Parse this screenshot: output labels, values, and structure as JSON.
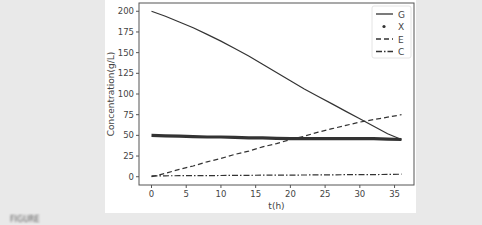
{
  "chart_data": {
    "type": "line",
    "title": "",
    "xlabel": "t(h)",
    "ylabel": "Concentration(g/L)",
    "xlim": [
      -1.8,
      37.8
    ],
    "ylim": [
      -10,
      210
    ],
    "xticks": [
      0,
      5,
      10,
      15,
      20,
      25,
      30,
      35
    ],
    "yticks": [
      0,
      25,
      50,
      75,
      100,
      125,
      150,
      175,
      200
    ],
    "grid": false,
    "legend_position": "upper right",
    "x": [
      0,
      2,
      4,
      6,
      8,
      10,
      12,
      14,
      16,
      18,
      20,
      22,
      24,
      26,
      28,
      30,
      32,
      34,
      36
    ],
    "series": [
      {
        "name": "G",
        "style": "solid",
        "values": [
          200,
          194,
          187,
          180,
          172,
          164,
          155,
          146,
          136,
          126,
          116,
          106,
          97,
          88,
          79,
          70,
          61,
          52,
          45
        ]
      },
      {
        "name": "X",
        "style": "dots",
        "values": [
          50,
          49.5,
          49,
          48.5,
          48,
          48,
          47.5,
          47,
          47,
          46.5,
          46,
          46,
          46,
          46,
          46,
          46,
          46,
          45.5,
          45
        ]
      },
      {
        "name": "E",
        "style": "dashed",
        "values": [
          0,
          4,
          9,
          13,
          18,
          22,
          27,
          31,
          36,
          40,
          45,
          49,
          54,
          58,
          62,
          66,
          69,
          72,
          75
        ]
      },
      {
        "name": "C",
        "style": "dashdot",
        "values": [
          1,
          1.1,
          1.2,
          1.3,
          1.4,
          1.5,
          1.6,
          1.7,
          1.8,
          1.9,
          2.0,
          2.1,
          2.2,
          2.3,
          2.4,
          2.5,
          2.6,
          2.8,
          3.0
        ]
      }
    ]
  },
  "colors": {
    "line": "#333333",
    "axis": "#555555",
    "text": "#444444",
    "figure_bg": "#ffffff",
    "page_bg": "#e9e9e9"
  },
  "caption": "FIGURE"
}
